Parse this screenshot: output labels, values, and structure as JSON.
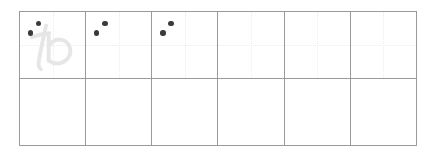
{
  "worksheet": {
    "title": "Hiragana writing practice grid",
    "script": "hiragana",
    "character": "わ",
    "character_romaji": "wa",
    "stroke_count": 2,
    "columns": 6,
    "rows": 2,
    "colors": {
      "border": "#9a9a9a",
      "guide_line": "#ededed",
      "trace_character": "#e6e6e6",
      "stroke_dot": "#3b3b3b",
      "background": "#ffffff"
    },
    "cells": [
      {
        "id": "r1c1",
        "row": 1,
        "col": 1,
        "trace_character": "わ",
        "show_trace": true,
        "show_guides": true,
        "stroke_dots": 2,
        "filled": false
      },
      {
        "id": "r1c2",
        "row": 1,
        "col": 2,
        "trace_character": "",
        "show_trace": false,
        "show_guides": true,
        "stroke_dots": 2,
        "filled": false
      },
      {
        "id": "r1c3",
        "row": 1,
        "col": 3,
        "trace_character": "",
        "show_trace": false,
        "show_guides": true,
        "stroke_dots": 2,
        "filled": false
      },
      {
        "id": "r1c4",
        "row": 1,
        "col": 4,
        "trace_character": "",
        "show_trace": false,
        "show_guides": true,
        "stroke_dots": 0,
        "filled": false
      },
      {
        "id": "r1c5",
        "row": 1,
        "col": 5,
        "trace_character": "",
        "show_trace": false,
        "show_guides": true,
        "stroke_dots": 0,
        "filled": false
      },
      {
        "id": "r1c6",
        "row": 1,
        "col": 6,
        "trace_character": "",
        "show_trace": false,
        "show_guides": true,
        "stroke_dots": 0,
        "filled": false
      },
      {
        "id": "r2c1",
        "row": 2,
        "col": 1,
        "trace_character": "",
        "show_trace": false,
        "show_guides": false,
        "stroke_dots": 0,
        "filled": false
      },
      {
        "id": "r2c2",
        "row": 2,
        "col": 2,
        "trace_character": "",
        "show_trace": false,
        "show_guides": false,
        "stroke_dots": 0,
        "filled": false
      },
      {
        "id": "r2c3",
        "row": 2,
        "col": 3,
        "trace_character": "",
        "show_trace": false,
        "show_guides": false,
        "stroke_dots": 0,
        "filled": false
      },
      {
        "id": "r2c4",
        "row": 2,
        "col": 4,
        "trace_character": "",
        "show_trace": false,
        "show_guides": false,
        "stroke_dots": 0,
        "filled": false
      },
      {
        "id": "r2c5",
        "row": 2,
        "col": 5,
        "trace_character": "",
        "show_trace": false,
        "show_guides": false,
        "stroke_dots": 0,
        "filled": false
      },
      {
        "id": "r2c6",
        "row": 2,
        "col": 6,
        "trace_character": "",
        "show_trace": false,
        "show_guides": false,
        "stroke_dots": 0,
        "filled": false
      }
    ]
  }
}
